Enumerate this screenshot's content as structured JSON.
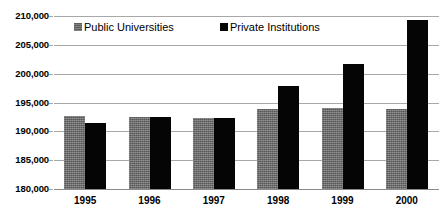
{
  "chart_data": {
    "type": "bar",
    "title": "",
    "xlabel": "",
    "ylabel": "",
    "categories": [
      "1995",
      "1996",
      "1997",
      "1998",
      "1999",
      "2000"
    ],
    "series": [
      {
        "name": "Public Universities",
        "color": "#6a6a6a",
        "values": [
          192700,
          192500,
          192400,
          193800,
          194000,
          193900
        ]
      },
      {
        "name": "Private Institutions",
        "color": "#050505",
        "values": [
          191500,
          192500,
          192400,
          197900,
          201700,
          209300
        ]
      }
    ],
    "ylim": [
      180000,
      210000
    ],
    "ytick_step": 5000,
    "yticks": [
      "180,000",
      "185,000",
      "190,000",
      "195,000",
      "200,000",
      "205,000",
      "210,000"
    ],
    "grid": true,
    "legend_position": "top-inside"
  },
  "legend": {
    "public_label": "Public Universities",
    "private_label": "Private Institutions"
  }
}
